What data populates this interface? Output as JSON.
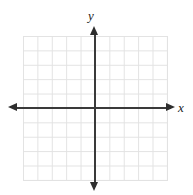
{
  "figure": {
    "title": ""
  },
  "axes": {
    "x_label": "x",
    "y_label": "y",
    "axis_color": "#3a3a3a",
    "arrow_color": "#2e2e2e",
    "x_arrow_left_name": "left arrow",
    "x_arrow_right_name": "right arrow",
    "y_arrow_up_name": "up arrow",
    "y_arrow_down_name": "down arrow"
  },
  "grid": {
    "color": "#e2e2e2",
    "background": "#ffffff",
    "columns": 10,
    "rows": 10,
    "cell_size_px": 14.4
  },
  "chart_data": {
    "type": "scatter",
    "title": "",
    "xlabel": "x",
    "ylabel": "y",
    "x": [],
    "y": [],
    "series": [],
    "xlim": [
      -5,
      5
    ],
    "ylim": [
      -5,
      5
    ],
    "xticks": [
      -5,
      -4,
      -3,
      -2,
      -1,
      0,
      1,
      2,
      3,
      4,
      5
    ],
    "yticks": [
      -5,
      -4,
      -3,
      -2,
      -1,
      0,
      1,
      2,
      3,
      4,
      5
    ],
    "xticklabels": [
      "",
      "",
      "",
      "",
      "",
      "",
      "",
      "",
      "",
      "",
      ""
    ],
    "yticklabels": [
      "",
      "",
      "",
      "",
      "",
      "",
      "",
      "",
      "",
      "",
      ""
    ],
    "grid": true,
    "legend": null,
    "annotations": []
  }
}
